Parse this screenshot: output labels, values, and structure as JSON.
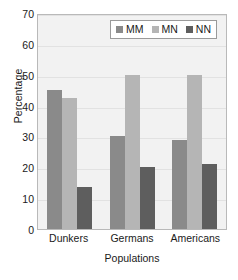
{
  "chart_data": {
    "type": "bar",
    "title": "",
    "categories": [
      "Dunkers",
      "Germans",
      "Americans"
    ],
    "series": [
      {
        "name": "MM",
        "values": [
          45,
          30,
          29
        ],
        "color": "#8a8a8a"
      },
      {
        "name": "MN",
        "values": [
          42.5,
          50,
          50
        ],
        "color": "#b5b5b5"
      },
      {
        "name": "NN",
        "values": [
          13.5,
          20,
          21
        ],
        "color": "#5e5e5e"
      }
    ],
    "xlabel": "Populations",
    "ylabel": "Percentage",
    "ylim": [
      0,
      70
    ],
    "yticks": [
      0,
      10,
      20,
      30,
      40,
      50,
      60,
      70
    ],
    "grid": true,
    "legend_position": "top-right",
    "plot_background": "#f2f2f2"
  }
}
